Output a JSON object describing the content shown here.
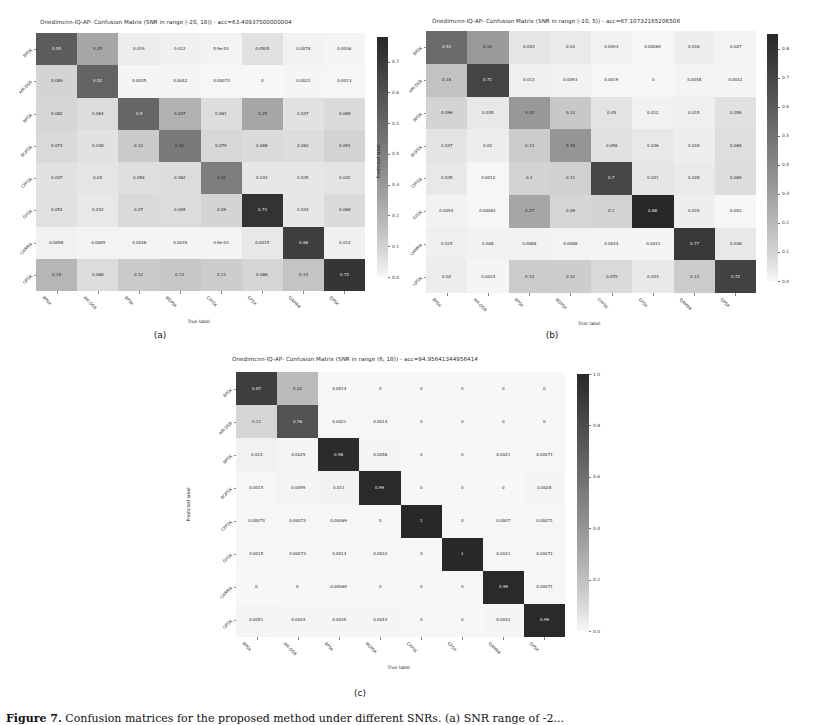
{
  "figure": {
    "caption_prefix": "Figure 7.",
    "caption_text": "Confusion matrices for the proposed method under different SNRs. (a) SNR range of -2..."
  },
  "classes": [
    "8PSK",
    "AM-DSB",
    "BPSK",
    "BQPSK",
    "CPFSK",
    "GFSK",
    "QAM64",
    "QPSK"
  ],
  "axis": {
    "xlabel": "True label",
    "ylabel": "Predicted label"
  },
  "chart_data": [
    {
      "type": "heatmap",
      "panel": "a",
      "caption": "(a)",
      "title": "Onedimcnn-IQ-AP- Confusion Matrix (SNR in range (-20, 18)) - acc=63.40937500000004",
      "xlabel": "True label",
      "ylabel": "Predicted label",
      "categories": [
        "8PSK",
        "AM-DSB",
        "BPSK",
        "BQPSK",
        "CPFSK",
        "GFSK",
        "QAM64",
        "QPSK"
      ],
      "colorbar": {
        "min": 0.0,
        "max": 0.7,
        "ticks": [
          0.0,
          0.1,
          0.2,
          0.3,
          0.4,
          0.5,
          0.6,
          0.7
        ]
      },
      "vmax": 0.78,
      "values": [
        [
          "0.55",
          "0.25",
          "0.019",
          "0.012",
          "5.9e-03",
          "0.0505",
          "0.0078",
          "0.0036"
        ],
        [
          "0.089",
          "0.52",
          "0.0035",
          "0.0042",
          "0.00073",
          "0",
          "0.0022",
          "0.0013"
        ],
        [
          "0.082",
          "0.064",
          "0.5",
          "0.207",
          "0.061",
          "0.25",
          "0.047",
          "0.069"
        ],
        [
          "0.074",
          "0.048",
          "0.12",
          "0.42",
          "0.079",
          "0.068",
          "0.062",
          "0.091"
        ],
        [
          "0.047",
          "0.04",
          "0.056",
          "0.062",
          "0.41",
          "0.034",
          "0.035",
          "0.042"
        ],
        [
          "0.052",
          "0.032",
          "0.07",
          "0.065",
          "0.09",
          "0.73",
          "0.034",
          "0.068"
        ],
        [
          "0.0098",
          "0.0065",
          "0.0048",
          "0.0035",
          "3.9e-03",
          "0.0315",
          "0.68",
          "0.012"
        ],
        [
          "0.19",
          "0.066",
          "0.12",
          "0.13",
          "0.11",
          "0.086",
          "0.14",
          "0.72"
        ]
      ]
    },
    {
      "type": "heatmap",
      "panel": "b",
      "caption": "(b)",
      "title": "Onedimcnn-IQ-AP- Confusion Matrix (SNR in range (-10, 5)) - acc=67.10732165206508",
      "xlabel": "True label",
      "ylabel": "Predicted label",
      "categories": [
        "8PSK",
        "AM-DSB",
        "BPSK",
        "BQPSK",
        "CPFSK",
        "GFSK",
        "QAM64",
        "QPSK"
      ],
      "colorbar": {
        "min": 0.0,
        "max": 0.8,
        "ticks": [
          0.0,
          0.1,
          0.2,
          0.3,
          0.4,
          0.5,
          0.6,
          0.7,
          0.8
        ]
      },
      "vmax": 0.85,
      "values": [
        [
          "0.53",
          "0.32",
          "0.043",
          "0.03",
          "0.0093",
          "0.00069",
          "0.018",
          "0.007"
        ],
        [
          "0.16",
          "0.71",
          "0.013",
          "0.0093",
          "0.0019",
          "0",
          "0.0048",
          "0.0032"
        ],
        [
          "0.096",
          "0.035",
          "0.33",
          "0.14",
          "0.05",
          "0.012",
          "0.015",
          "0.056"
        ],
        [
          "0.047",
          "0.02",
          "0.13",
          "0.34",
          "0.056",
          "0.036",
          "0.018",
          "0.065"
        ],
        [
          "0.035",
          "0.0012",
          "0.1",
          "0.11",
          "0.7",
          "0.041",
          "0.028",
          "0.069"
        ],
        [
          "0.0094",
          "0.00061",
          "0.27",
          "0.09",
          "0.1",
          "0.88",
          "0.019",
          "0.001"
        ],
        [
          "0.015",
          "0.008",
          "0.0088",
          "0.0068",
          "0.0044",
          "0.0031",
          "0.77",
          "0.036"
        ],
        [
          "0.02",
          "0.0024",
          "0.13",
          "0.12",
          "0.079",
          "0.033",
          "0.13",
          "0.72"
        ]
      ]
    },
    {
      "type": "heatmap",
      "panel": "c",
      "caption": "(c)",
      "title": "Onedimcnn-IQ-AP- Confusion Matrix (SNR in range (6, 18)) - acc=94.95641344956414",
      "xlabel": "True label",
      "ylabel": "Predicted label",
      "categories": [
        "8PSK",
        "AM-DSB",
        "BPSK",
        "BQPSK",
        "CPFSK",
        "GFSK",
        "QAM64",
        "QPSK"
      ],
      "colorbar": {
        "min": 0.0,
        "max": 1.0,
        "ticks": [
          0.0,
          0.2,
          0.4,
          0.6,
          0.8,
          1.0
        ]
      },
      "vmax": 1.0,
      "values": [
        [
          "0.87",
          "0.22",
          "0.0014",
          "0",
          "0",
          "0",
          "0",
          "0"
        ],
        [
          "0.11",
          "0.76",
          "0.0021",
          "0.0014",
          "0",
          "0",
          "0",
          "0"
        ],
        [
          "0.013",
          "0.0029",
          "0.98",
          "0.0058",
          "0",
          "0",
          "0.0021",
          "0.00071"
        ],
        [
          "0.0015",
          "0.0059",
          "0.011",
          "0.99",
          "0",
          "0",
          "0",
          "0.0028"
        ],
        [
          "0.00073",
          "0.00073",
          "0.00069",
          "0",
          "1",
          "0",
          "0.0007",
          "0.00071"
        ],
        [
          "0.0015",
          "0.00073",
          "0.0014",
          "0.0022",
          "0",
          "1",
          "0.0021",
          "0.00071"
        ],
        [
          "0",
          "0",
          "0.00069",
          "0",
          "0",
          "0",
          "0.99",
          "0.00071"
        ],
        [
          "0.0051",
          "0.0044",
          "0.0035",
          "0.0043",
          "0",
          "0",
          "0.0042",
          "0.99"
        ]
      ]
    }
  ]
}
